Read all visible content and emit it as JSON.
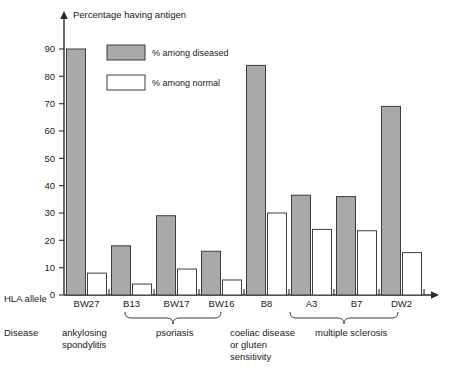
{
  "chart_data": {
    "type": "bar",
    "title": "Percentage having antigen",
    "xlabel": "HLA allele",
    "ylabel": "Percentage having antigen",
    "ylim": [
      0,
      95
    ],
    "grid": false,
    "legend_position": "top-left-inside",
    "categories": [
      "BW27",
      "B13",
      "BW17",
      "BW16",
      "B8",
      "A3",
      "B7",
      "DW2"
    ],
    "series": [
      {
        "name": "% among diseased",
        "color": "#a9a9a9",
        "values": [
          90,
          18,
          29,
          16,
          84,
          36.5,
          36,
          69
        ]
      },
      {
        "name": "% among normal",
        "color": "#ffffff",
        "values": [
          8,
          4,
          9.5,
          5.5,
          30,
          24,
          23.5,
          15.5
        ]
      }
    ],
    "ytick_labels": [
      "0",
      "10",
      "20",
      "30",
      "40",
      "50",
      "60",
      "70",
      "80",
      "90"
    ],
    "ytick_values": [
      0,
      10,
      20,
      30,
      40,
      50,
      60,
      70,
      80,
      90
    ],
    "group_row_label": "Disease",
    "allele_row_label": "HLA allele",
    "groups": [
      {
        "label": "ankylosing\nspondylitis",
        "members": [
          "BW27"
        ],
        "brace": false
      },
      {
        "label": "psoriasis",
        "members": [
          "B13",
          "BW17",
          "BW16"
        ],
        "brace": true
      },
      {
        "label": "coeliac disease\nor gluten\nsensitivity",
        "members": [
          "B8"
        ],
        "brace": false
      },
      {
        "label": "multiple sclerosis",
        "members": [
          "A3",
          "B7",
          "DW2"
        ],
        "brace": true
      }
    ]
  },
  "legend": {
    "items": [
      {
        "label": "% among diseased",
        "swatch": "gray"
      },
      {
        "label": "% among normal",
        "swatch": "white"
      }
    ]
  },
  "group_labels": {
    "ankylosing_line1": "ankylosing",
    "ankylosing_line2": "spondylitis",
    "psoriasis": "psoriasis",
    "coeliac_line1": "coeliac disease",
    "coeliac_line2": "or gluten",
    "coeliac_line3": "sensitivity",
    "ms": "multiple sclerosis"
  },
  "row_labels": {
    "hla": "HLA allele",
    "disease": "Disease"
  },
  "axis": {
    "title": "Percentage having antigen",
    "zero_label": "0"
  }
}
